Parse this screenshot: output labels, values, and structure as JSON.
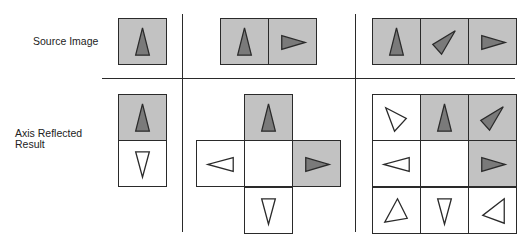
{
  "labels": {
    "source": "Source Image",
    "result_line1": "Axis Reflected",
    "result_line2": "Result"
  },
  "colors": {
    "cell_filled": "#c2c2c2",
    "cell_empty": "#ffffff",
    "triangle_filled": "#7a7a7a",
    "triangle_empty": "#ffffff",
    "stroke": "#2a2a2a"
  },
  "columns": [
    {
      "name": "single",
      "source": [
        {
          "x": 118,
          "y": 18,
          "fill": true,
          "dir": "up"
        }
      ],
      "result": [
        {
          "x": 118,
          "y": 94,
          "fill": true,
          "dir": "up"
        },
        {
          "x": 118,
          "y": 140,
          "fill": false,
          "dir": "down"
        }
      ]
    },
    {
      "name": "pair",
      "source": [
        {
          "x": 220,
          "y": 18,
          "fill": true,
          "dir": "up"
        },
        {
          "x": 268,
          "y": 18,
          "fill": true,
          "dir": "right"
        }
      ],
      "result": [
        {
          "x": 244,
          "y": 94,
          "fill": true,
          "dir": "up"
        },
        {
          "x": 196,
          "y": 140,
          "fill": false,
          "dir": "left"
        },
        {
          "x": 244,
          "y": 140,
          "fill": false,
          "dir": "none"
        },
        {
          "x": 292,
          "y": 140,
          "fill": true,
          "dir": "right"
        },
        {
          "x": 244,
          "y": 187,
          "fill": false,
          "dir": "down"
        }
      ]
    },
    {
      "name": "triple",
      "source": [
        {
          "x": 372,
          "y": 18,
          "fill": true,
          "dir": "up"
        },
        {
          "x": 420,
          "y": 18,
          "fill": true,
          "dir": "upright"
        },
        {
          "x": 468,
          "y": 18,
          "fill": true,
          "dir": "right"
        }
      ],
      "result": [
        {
          "x": 372,
          "y": 94,
          "fill": false,
          "dir": "downright"
        },
        {
          "x": 420,
          "y": 94,
          "fill": true,
          "dir": "up"
        },
        {
          "x": 468,
          "y": 94,
          "fill": true,
          "dir": "upright"
        },
        {
          "x": 372,
          "y": 140,
          "fill": false,
          "dir": "left"
        },
        {
          "x": 420,
          "y": 140,
          "fill": false,
          "dir": "none"
        },
        {
          "x": 468,
          "y": 140,
          "fill": true,
          "dir": "right"
        },
        {
          "x": 372,
          "y": 187,
          "fill": false,
          "dir": "upleft_r"
        },
        {
          "x": 420,
          "y": 187,
          "fill": false,
          "dir": "down"
        },
        {
          "x": 468,
          "y": 187,
          "fill": false,
          "dir": "downleft"
        }
      ]
    }
  ]
}
